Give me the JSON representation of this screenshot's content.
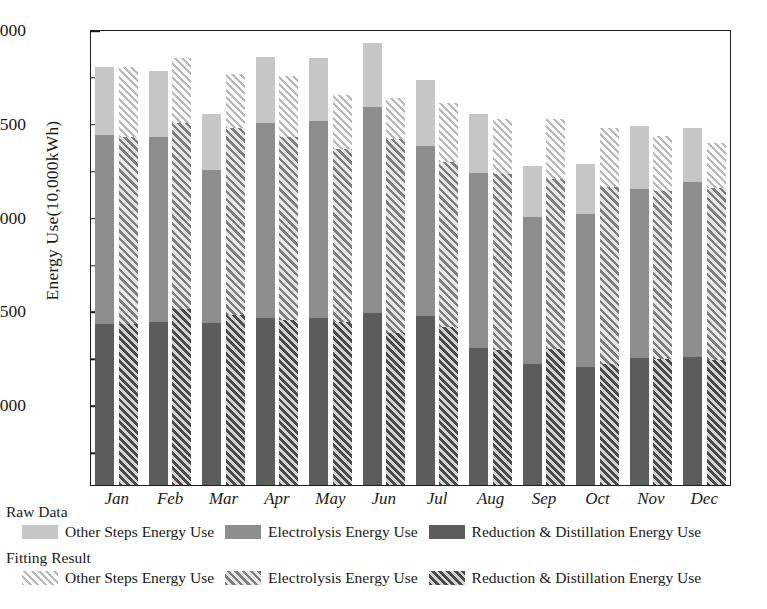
{
  "chart_data": {
    "type": "bar",
    "title": "",
    "subtitle": "",
    "xlabel": "",
    "ylabel": "Energy Use(10,000kWh)",
    "ylim": [
      570,
      3000
    ],
    "grid": false,
    "stacked": true,
    "grouped_pairs": true,
    "legend_position": "below-axes",
    "y_ticks_major": [
      1000,
      1500,
      2000,
      2500,
      3000
    ],
    "y_ticks_minor": [
      750,
      1250,
      1750,
      2250,
      2750
    ],
    "categories": [
      "Jan",
      "Feb",
      "Mar",
      "Apr",
      "May",
      "Jun",
      "Jul",
      "Aug",
      "Sep",
      "Oct",
      "Nov",
      "Dec"
    ],
    "groups": [
      {
        "name": "Raw Data",
        "style": "solid",
        "series": [
          {
            "name": "Reduction & Distillation Energy Use",
            "color": "#5c5c5c",
            "values": [
              1075,
              1095,
              1110,
              1110,
              1115,
              1140,
              1135,
              940,
              860,
              840,
              880,
              890
            ]
          },
          {
            "name": "Electrolysis Energy Use",
            "color": "#8d8d8d",
            "values": [
              1265,
              1240,
              1055,
              1300,
              1310,
              1360,
              1145,
              1200,
              1045,
              1085,
              1170,
              1210
            ]
          },
          {
            "name": "Other Steps Energy Use",
            "color": "#c6c6c6",
            "values": [
              455,
              440,
              380,
              440,
              420,
              425,
              450,
              405,
              365,
              355,
              435,
              370
            ]
          }
        ]
      },
      {
        "name": "Fitting Result",
        "style": "hatched",
        "series": [
          {
            "name": "Reduction & Distillation Energy Use",
            "color": "#4a4a4a",
            "values": [
              1075,
              1175,
              1140,
              1110,
              1105,
              1035,
              1075,
              930,
              935,
              840,
              880,
              875
            ]
          },
          {
            "name": "Electrolysis Energy Use",
            "color": "#7d7d7d",
            "values": [
              1255,
              1235,
              1255,
              1230,
              1175,
              1315,
              1130,
              1215,
              1175,
              1225,
              1170,
              1200
            ]
          },
          {
            "name": "Other Steps Energy Use",
            "color": "#b9b9b9",
            "values": [
              470,
              435,
              365,
              410,
              370,
              285,
              400,
              375,
              410,
              410,
              380,
              320
            ]
          }
        ]
      }
    ],
    "totals": {
      "raw": [
        2795,
        2775,
        2545,
        2850,
        2845,
        2925,
        2730,
        2545,
        2270,
        2280,
        2485,
        2470
      ],
      "fitting": [
        2800,
        2845,
        2760,
        2750,
        2650,
        2635,
        2605,
        2520,
        2520,
        2475,
        2430,
        2395
      ]
    }
  },
  "legend": {
    "groups": [
      {
        "title": "Raw Data",
        "entries": [
          {
            "label": "Other Steps Energy Use",
            "swatch": "solid-light"
          },
          {
            "label": "Electrolysis Energy Use",
            "swatch": "solid-mid"
          },
          {
            "label": "Reduction & Distillation Energy Use",
            "swatch": "solid-dark"
          }
        ]
      },
      {
        "title": "Fitting Result",
        "entries": [
          {
            "label": "Other Steps Energy Use",
            "swatch": "hatch-light"
          },
          {
            "label": "Electrolysis Energy Use",
            "swatch": "hatch-mid"
          },
          {
            "label": "Reduction & Distillation Energy Use",
            "swatch": "hatch-dark"
          }
        ]
      }
    ]
  },
  "colors": {
    "light": "#c6c6c6",
    "mid": "#8d8d8d",
    "dark": "#5c5c5c",
    "axis": "#1b1b1b",
    "text": "#1a1a1a",
    "background": "#ffffff"
  }
}
